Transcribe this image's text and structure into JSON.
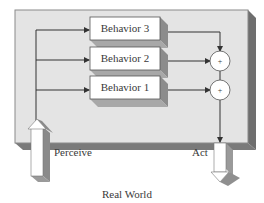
{
  "diagram": {
    "type": "subsumption-architecture",
    "behaviors": [
      {
        "label": "Behavior 3"
      },
      {
        "label": "Behavior 2"
      },
      {
        "label": "Behavior 1"
      }
    ],
    "combiners": [
      {
        "symbol": "+"
      },
      {
        "symbol": "+"
      }
    ],
    "input_label": "Perceive",
    "output_label": "Act",
    "environment_label": "Real World"
  },
  "colors": {
    "panel_face": "#e4e4e4",
    "panel_side": "#6e6e6e",
    "panel_bottom": "#7a7a7a",
    "box_face": "#ffffff",
    "box_shadow": "#9a9a9a",
    "line": "#333333",
    "text": "#3a3a3a"
  }
}
